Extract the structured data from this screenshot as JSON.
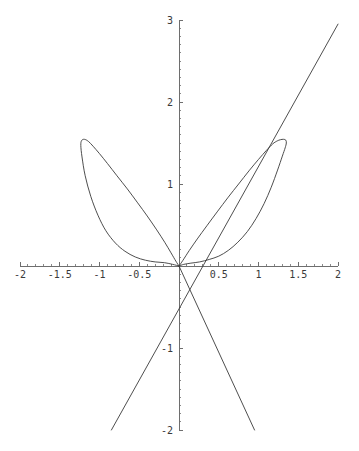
{
  "chart_data": {
    "type": "line",
    "title": "",
    "subtitle": "",
    "xlabel": "",
    "ylabel": "",
    "xlim": [
      -2,
      2
    ],
    "ylim": [
      -2,
      3
    ],
    "grid": false,
    "legend": null,
    "background": "#ffffff",
    "curve_color": "#3a3a3a",
    "axis_color": "#6e6e6e",
    "label_color": "#3a3a3a",
    "x_ticks": [
      {
        "value": -2,
        "label": "-2"
      },
      {
        "value": -1.5,
        "label": "-1.5"
      },
      {
        "value": -1,
        "label": "-1"
      },
      {
        "value": -0.5,
        "label": "-0.5"
      },
      {
        "value": 0.5,
        "label": "0.5"
      },
      {
        "value": 1,
        "label": "1"
      },
      {
        "value": 1.5,
        "label": "1.5"
      },
      {
        "value": 2,
        "label": "2"
      }
    ],
    "y_ticks": [
      {
        "value": 3,
        "label": "3"
      },
      {
        "value": 2,
        "label": "2"
      },
      {
        "value": 1,
        "label": "1"
      },
      {
        "value": -1,
        "label": "-1"
      },
      {
        "value": -2,
        "label": "-2"
      }
    ],
    "x_minor_ticks": [
      -1.9,
      -1.8,
      -1.7,
      -1.6,
      -1.4,
      -1.3,
      -1.2,
      -1.1,
      -0.9,
      -0.8,
      -0.7,
      -0.6,
      -0.4,
      -0.3,
      -0.2,
      -0.1,
      0.1,
      0.2,
      0.3,
      0.4,
      0.6,
      0.7,
      0.8,
      0.9,
      1.1,
      1.2,
      1.3,
      1.4,
      1.6,
      1.7,
      1.8,
      1.9
    ],
    "y_minor_ticks": [
      2.9,
      2.8,
      2.7,
      2.6,
      2.5,
      2.4,
      2.3,
      2.2,
      2.1,
      1.9,
      1.8,
      1.7,
      1.6,
      1.5,
      1.4,
      1.3,
      1.2,
      1.1,
      0.9,
      0.8,
      0.7,
      0.6,
      0.5,
      0.4,
      0.3,
      0.2,
      0.1,
      -0.1,
      -0.2,
      -0.3,
      -0.4,
      -0.5,
      -0.6,
      -0.7,
      -0.8,
      -0.9,
      -1.1,
      -1.2,
      -1.3,
      -1.4,
      -1.5,
      -1.6,
      -1.7,
      -1.8,
      -1.9
    ],
    "series": [
      {
        "name": "left-loop",
        "kind": "closed-loop",
        "points": [
          [
            0.0,
            0.0
          ],
          [
            -0.08,
            0.02
          ],
          [
            -0.18,
            0.04
          ],
          [
            -0.3,
            0.05
          ],
          [
            -0.42,
            0.07
          ],
          [
            -0.55,
            0.11
          ],
          [
            -0.68,
            0.18
          ],
          [
            -0.8,
            0.28
          ],
          [
            -0.92,
            0.43
          ],
          [
            -1.02,
            0.62
          ],
          [
            -1.11,
            0.85
          ],
          [
            -1.18,
            1.1
          ],
          [
            -1.22,
            1.33
          ],
          [
            -1.235,
            1.47
          ],
          [
            -1.225,
            1.53
          ],
          [
            -1.19,
            1.545
          ],
          [
            -1.14,
            1.52
          ],
          [
            -1.08,
            1.46
          ],
          [
            -1.0,
            1.37
          ],
          [
            -0.9,
            1.25
          ],
          [
            -0.78,
            1.1
          ],
          [
            -0.65,
            0.94
          ],
          [
            -0.52,
            0.77
          ],
          [
            -0.4,
            0.61
          ],
          [
            -0.28,
            0.44
          ],
          [
            -0.18,
            0.29
          ],
          [
            -0.1,
            0.16
          ],
          [
            -0.04,
            0.06
          ],
          [
            0.0,
            0.0
          ]
        ]
      },
      {
        "name": "right-loop",
        "kind": "closed-loop-with-cusp",
        "points": [
          [
            0.0,
            0.0
          ],
          [
            0.06,
            0.02
          ],
          [
            0.15,
            0.035
          ],
          [
            0.26,
            0.05
          ],
          [
            0.38,
            0.08
          ],
          [
            0.5,
            0.12
          ],
          [
            0.62,
            0.19
          ],
          [
            0.74,
            0.29
          ],
          [
            0.86,
            0.42
          ],
          [
            0.97,
            0.58
          ],
          [
            1.07,
            0.76
          ],
          [
            1.16,
            0.96
          ],
          [
            1.24,
            1.17
          ],
          [
            1.3,
            1.34
          ],
          [
            1.335,
            1.44
          ],
          [
            1.35,
            1.5
          ],
          [
            1.343,
            1.535
          ],
          [
            1.315,
            1.545
          ],
          [
            1.275,
            1.54
          ],
          [
            1.235,
            1.525
          ],
          [
            1.18,
            1.49
          ],
          [
            1.1,
            1.41
          ],
          [
            1.0,
            1.3
          ],
          [
            0.88,
            1.16
          ],
          [
            0.75,
            1.0
          ],
          [
            0.62,
            0.84
          ],
          [
            0.48,
            0.66
          ],
          [
            0.35,
            0.49
          ],
          [
            0.23,
            0.33
          ],
          [
            0.13,
            0.19
          ],
          [
            0.05,
            0.07
          ],
          [
            0.0,
            0.0
          ]
        ]
      },
      {
        "name": "tangent-line-rising",
        "kind": "line",
        "points": [
          [
            -0.85,
            -2.0
          ],
          [
            2.0,
            2.95
          ]
        ]
      },
      {
        "name": "tangent-line-falling",
        "kind": "line",
        "points": [
          [
            0.0,
            0.0
          ],
          [
            0.95,
            -2.0
          ]
        ]
      }
    ]
  },
  "figure": {
    "caption": ""
  }
}
